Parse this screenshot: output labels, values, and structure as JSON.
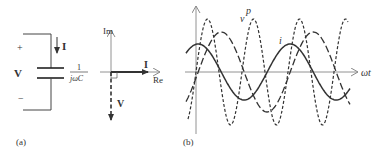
{
  "panel_a": {
    "label": "(a)",
    "circuit": {
      "plus": "+",
      "minus": "−",
      "voltage": "V",
      "current": "I",
      "impedance_num": "1",
      "impedance_den": "jωC"
    },
    "phasor": {
      "im_axis": "Im",
      "re_axis": "Re",
      "current": "I",
      "voltage": "V"
    }
  },
  "panel_b": {
    "label": "(b)",
    "x_axis": "ωt",
    "curves": {
      "v": "v",
      "p": "p",
      "i": "i"
    }
  },
  "colors": {
    "line": "#333333",
    "axis": "#777777"
  }
}
